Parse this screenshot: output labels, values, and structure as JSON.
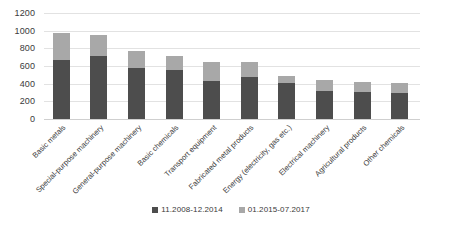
{
  "chart_data": {
    "type": "bar",
    "stacked": true,
    "title": "",
    "subtitle": "",
    "xlabel": "",
    "ylabel": "",
    "ylim": [
      0,
      1200
    ],
    "ytick_step": 200,
    "yticks": [
      1200,
      1000,
      800,
      600,
      400,
      200,
      0
    ],
    "ytick_labels": [
      "1200",
      "1000",
      "800",
      "600",
      "400",
      "200",
      "0"
    ],
    "grid": true,
    "grid_axis": "y",
    "legend_position": "bottom-center",
    "categories": [
      "Basic metals",
      "Special-purpose machinery",
      "General-purpose machinery",
      "Basic chemicals",
      "Transport equipment",
      "Fabricated metal products",
      "Energy (electricity, gas etc.)",
      "Electrical machinery",
      "Agricultural products",
      "Other chemicals"
    ],
    "series": [
      {
        "name": "11.2008-12.2014",
        "color": "#4d4d4d",
        "values": [
          670,
          718,
          575,
          555,
          428,
          480,
          412,
          315,
          308,
          295
        ]
      },
      {
        "name": "01.2015-07.2017",
        "color": "#a8a8a8",
        "values": [
          300,
          232,
          195,
          160,
          222,
          160,
          80,
          122,
          112,
          110
        ]
      }
    ],
    "totals": [
      970,
      950,
      770,
      715,
      650,
      640,
      492,
      437,
      420,
      405
    ]
  },
  "legend": {
    "items": [
      {
        "label": "11.2008-12.2014",
        "color": "#4d4d4d"
      },
      {
        "label": "01.2015-07.2017",
        "color": "#a8a8a8"
      }
    ]
  },
  "colors": {
    "series_dark": "#4d4d4d",
    "series_light": "#a8a8a8",
    "gridline": "#e2e2e2",
    "axis_text": "#3a3a3a",
    "background": "#ffffff"
  }
}
